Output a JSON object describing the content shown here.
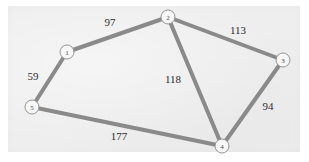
{
  "figure": {
    "kind": "weighted-undirected-graph",
    "background_color": "#ffffff",
    "panel_color": "#eeeeee",
    "edge_color": "#8a8a8a",
    "node_fill_color": "#f7f7f7",
    "node_border_color": "#8a8a8a",
    "label_color": "#2b2b2b"
  },
  "chart_data": {
    "type": "diagram",
    "title": "",
    "xlabel": "",
    "ylabel": "",
    "nodes": [
      {
        "id": "1",
        "label": "1",
        "x": 67,
        "y": 52,
        "r": 7
      },
      {
        "id": "2",
        "label": "2",
        "x": 168,
        "y": 17,
        "r": 7
      },
      {
        "id": "3",
        "label": "3",
        "x": 283,
        "y": 60,
        "r": 7
      },
      {
        "id": "4",
        "label": "4",
        "x": 222,
        "y": 146,
        "r": 7
      },
      {
        "id": "5",
        "label": "5",
        "x": 32,
        "y": 107,
        "r": 7
      }
    ],
    "edges": [
      {
        "from": "1",
        "to": "2",
        "weight": 97,
        "label": "97",
        "label_x": 110,
        "label_y": 22
      },
      {
        "from": "2",
        "to": "3",
        "weight": 113,
        "label": "113",
        "label_x": 238,
        "label_y": 30
      },
      {
        "from": "2",
        "to": "4",
        "weight": 118,
        "label": "118",
        "label_x": 173,
        "label_y": 79
      },
      {
        "from": "3",
        "to": "4",
        "weight": 94,
        "label": "94",
        "label_x": 268,
        "label_y": 106
      },
      {
        "from": "1",
        "to": "5",
        "weight": 59,
        "label": "59",
        "label_x": 33,
        "label_y": 76
      },
      {
        "from": "5",
        "to": "4",
        "weight": 177,
        "label": "177",
        "label_x": 119,
        "label_y": 136
      }
    ]
  }
}
